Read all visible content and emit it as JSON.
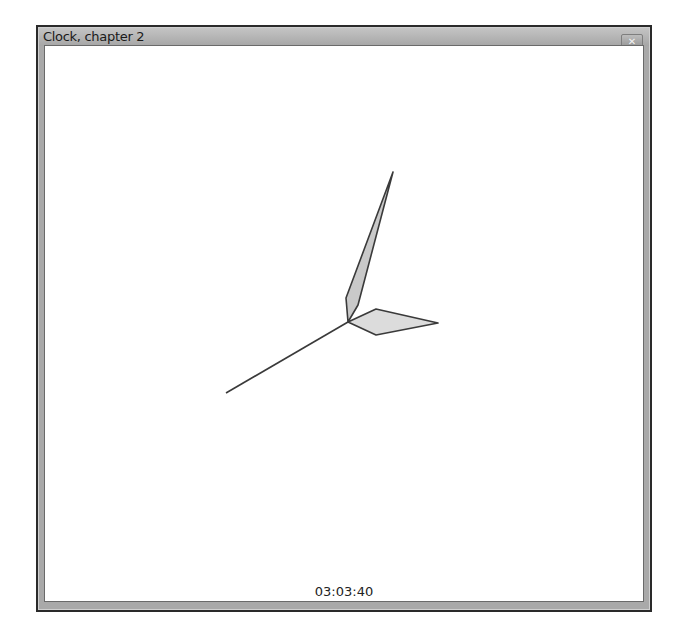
{
  "window": {
    "title": "Clock, chapter 2",
    "close_icon": "close-icon"
  },
  "clock": {
    "time_text": "03:03:40",
    "hour": 3,
    "minute": 3,
    "second": 40,
    "colors": {
      "hand_fill": "#d6d6d6",
      "hand_stroke": "#3a3a3a",
      "background": "#ffffff"
    }
  }
}
